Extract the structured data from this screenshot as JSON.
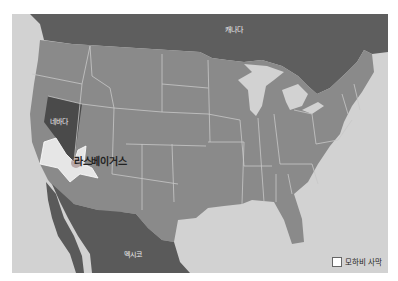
{
  "map": {
    "labels": {
      "canada": "캐나다",
      "nevada": "네바다",
      "las_vegas": "라스베이거스",
      "mexico": "멕시코"
    },
    "legend": {
      "label": "모하비 사막",
      "swatch_color": "#ffffff"
    },
    "colors": {
      "water": "#d2d2d2",
      "usa_land": "#8a8a8a",
      "canada": "#5e5e5e",
      "mexico": "#5a5a5a",
      "nevada": "#4a4a4a",
      "mojave": "#e6e6e6",
      "state_border": "#c8c8c8"
    }
  }
}
